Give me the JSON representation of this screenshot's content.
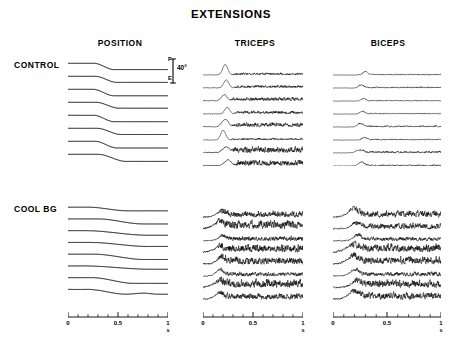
{
  "figure": {
    "title": "EXTENSIONS",
    "column_headers": [
      "POSITION",
      "TRICEPS",
      "BICEPS"
    ],
    "row_labels": [
      "CONTROL",
      "COOL BG"
    ]
  },
  "calibration": {
    "top_letter": "F",
    "bottom_letter": "E",
    "magnitude": "40°"
  },
  "axes": {
    "unit": "s",
    "tick_labels": [
      "0",
      "0.5",
      "1"
    ],
    "minor_ticks": 10,
    "range": [
      0,
      1
    ]
  },
  "chart_data": {
    "type": "line",
    "title": "EXTENSIONS",
    "xlabel": "s",
    "ylabel": "",
    "xlim": [
      0,
      1
    ],
    "grid": false,
    "legend": "none",
    "conditions": [
      "CONTROL",
      "COOL BG"
    ],
    "signals": [
      "POSITION",
      "TRICEPS",
      "BICEPS"
    ],
    "trials_per_panel": 8,
    "panels": [
      {
        "condition": "CONTROL",
        "signal": "POSITION",
        "kind": "position",
        "seed": 101,
        "traces": [
          {
            "onset": 0.26,
            "duration": 0.2,
            "amplitude": 0.62,
            "baseline": 0.0,
            "noise": 0.006
          },
          {
            "onset": 0.27,
            "duration": 0.22,
            "amplitude": 0.6,
            "baseline": 0.0,
            "noise": 0.006
          },
          {
            "onset": 0.25,
            "duration": 0.21,
            "amplitude": 0.64,
            "baseline": 0.0,
            "noise": 0.006
          },
          {
            "onset": 0.28,
            "duration": 0.23,
            "amplitude": 0.58,
            "baseline": 0.0,
            "noise": 0.006
          },
          {
            "onset": 0.26,
            "duration": 0.2,
            "amplitude": 0.63,
            "baseline": 0.0,
            "noise": 0.006
          },
          {
            "onset": 0.29,
            "duration": 0.24,
            "amplitude": 0.61,
            "baseline": 0.0,
            "noise": 0.006
          },
          {
            "onset": 0.27,
            "duration": 0.22,
            "amplitude": 0.66,
            "baseline": 0.0,
            "noise": 0.006
          },
          {
            "onset": 0.3,
            "duration": 0.28,
            "amplitude": 0.7,
            "baseline": 0.0,
            "noise": 0.006
          }
        ]
      },
      {
        "condition": "CONTROL",
        "signal": "TRICEPS",
        "kind": "emg",
        "seed": 202,
        "traces": [
          {
            "burst_onset": 0.22,
            "burst_width": 0.035,
            "burst_amp": 0.95,
            "tonic": 0.16,
            "tonic_onset": 0.28,
            "noise": 0.05
          },
          {
            "burst_onset": 0.23,
            "burst_width": 0.035,
            "burst_amp": 0.72,
            "tonic": 0.2,
            "tonic_onset": 0.29,
            "noise": 0.05
          },
          {
            "burst_onset": 0.21,
            "burst_width": 0.04,
            "burst_amp": 0.55,
            "tonic": 0.26,
            "tonic_onset": 0.26,
            "noise": 0.06
          },
          {
            "burst_onset": 0.24,
            "burst_width": 0.035,
            "burst_amp": 0.6,
            "tonic": 0.22,
            "tonic_onset": 0.3,
            "noise": 0.05
          },
          {
            "burst_onset": 0.22,
            "burst_width": 0.045,
            "burst_amp": 0.68,
            "tonic": 0.3,
            "tonic_onset": 0.27,
            "noise": 0.06
          },
          {
            "burst_onset": 0.2,
            "burst_width": 0.035,
            "burst_amp": 0.88,
            "tonic": 0.14,
            "tonic_onset": 0.26,
            "noise": 0.04
          },
          {
            "burst_onset": 0.23,
            "burst_width": 0.05,
            "burst_amp": 0.5,
            "tonic": 0.42,
            "tonic_onset": 0.27,
            "noise": 0.09
          },
          {
            "burst_onset": 0.25,
            "burst_width": 0.045,
            "burst_amp": 0.52,
            "tonic": 0.4,
            "tonic_onset": 0.3,
            "noise": 0.09
          }
        ]
      },
      {
        "condition": "CONTROL",
        "signal": "BICEPS",
        "kind": "emg",
        "seed": 303,
        "traces": [
          {
            "burst_onset": 0.3,
            "burst_width": 0.03,
            "burst_amp": 0.3,
            "tonic": 0.07,
            "tonic_onset": 0.2,
            "noise": 0.03
          },
          {
            "burst_onset": 0.26,
            "burst_width": 0.035,
            "burst_amp": 0.22,
            "tonic": 0.09,
            "tonic_onset": 0.2,
            "noise": 0.035
          },
          {
            "burst_onset": 0.28,
            "burst_width": 0.03,
            "burst_amp": 0.2,
            "tonic": 0.06,
            "tonic_onset": 0.22,
            "noise": 0.03
          },
          {
            "burst_onset": 0.27,
            "burst_width": 0.03,
            "burst_amp": 0.24,
            "tonic": 0.07,
            "tonic_onset": 0.21,
            "noise": 0.03
          },
          {
            "burst_onset": 0.25,
            "burst_width": 0.04,
            "burst_amp": 0.26,
            "tonic": 0.1,
            "tonic_onset": 0.2,
            "noise": 0.04
          },
          {
            "burst_onset": 0.29,
            "burst_width": 0.03,
            "burst_amp": 0.18,
            "tonic": 0.08,
            "tonic_onset": 0.22,
            "noise": 0.035
          },
          {
            "burst_onset": 0.24,
            "burst_width": 0.045,
            "burst_amp": 0.22,
            "tonic": 0.14,
            "tonic_onset": 0.2,
            "noise": 0.05
          },
          {
            "burst_onset": 0.26,
            "burst_width": 0.04,
            "burst_amp": 0.3,
            "tonic": 0.1,
            "tonic_onset": 0.21,
            "noise": 0.04
          }
        ]
      },
      {
        "condition": "COOL BG",
        "signal": "POSITION",
        "kind": "position",
        "seed": 404,
        "traces": [
          {
            "onset": 0.2,
            "duration": 0.4,
            "amplitude": 0.4,
            "baseline": 0.0,
            "noise": 0.01
          },
          {
            "onset": 0.3,
            "duration": 0.45,
            "amplitude": 0.55,
            "baseline": 0.0,
            "noise": 0.012
          },
          {
            "onset": 0.18,
            "duration": 0.62,
            "amplitude": 0.5,
            "baseline": 0.0,
            "noise": 0.012
          },
          {
            "onset": 0.22,
            "duration": 0.58,
            "amplitude": 0.44,
            "baseline": 0.0,
            "noise": 0.01
          },
          {
            "onset": 0.26,
            "duration": 0.5,
            "amplitude": 0.58,
            "baseline": 0.0,
            "noise": 0.012
          },
          {
            "onset": 0.16,
            "duration": 0.66,
            "amplitude": 0.36,
            "baseline": 0.0,
            "noise": 0.01
          },
          {
            "onset": 0.24,
            "duration": 0.42,
            "amplitude": 0.62,
            "baseline": 0.0,
            "noise": 0.014
          },
          {
            "onset": 0.2,
            "duration": 0.38,
            "amplitude": 0.52,
            "baseline": 0.0,
            "noise": 0.016,
            "rebound": 0.4
          }
        ]
      },
      {
        "condition": "COOL BG",
        "signal": "TRICEPS",
        "kind": "emg",
        "seed": 505,
        "traces": [
          {
            "burst_onset": 0.16,
            "burst_width": 0.06,
            "burst_amp": 0.4,
            "tonic": 0.46,
            "tonic_onset": 0.14,
            "noise": 0.16
          },
          {
            "burst_onset": 0.14,
            "burst_width": 0.07,
            "burst_amp": 0.5,
            "tonic": 0.62,
            "tonic_onset": 0.12,
            "noise": 0.22
          },
          {
            "burst_onset": 0.18,
            "burst_width": 0.055,
            "burst_amp": 0.34,
            "tonic": 0.34,
            "tonic_onset": 0.15,
            "noise": 0.13
          },
          {
            "burst_onset": 0.15,
            "burst_width": 0.065,
            "burst_amp": 0.42,
            "tonic": 0.58,
            "tonic_onset": 0.13,
            "noise": 0.2
          },
          {
            "burst_onset": 0.17,
            "burst_width": 0.06,
            "burst_amp": 0.46,
            "tonic": 0.54,
            "tonic_onset": 0.14,
            "noise": 0.19
          },
          {
            "burst_onset": 0.16,
            "burst_width": 0.05,
            "burst_amp": 0.58,
            "tonic": 0.3,
            "tonic_onset": 0.14,
            "noise": 0.12
          },
          {
            "burst_onset": 0.14,
            "burst_width": 0.07,
            "burst_amp": 0.44,
            "tonic": 0.6,
            "tonic_onset": 0.12,
            "noise": 0.21
          },
          {
            "burst_onset": 0.15,
            "burst_width": 0.06,
            "burst_amp": 0.52,
            "tonic": 0.44,
            "tonic_onset": 0.13,
            "noise": 0.17
          }
        ]
      },
      {
        "condition": "COOL BG",
        "signal": "BICEPS",
        "kind": "emg",
        "seed": 606,
        "traces": [
          {
            "burst_onset": 0.18,
            "burst_width": 0.07,
            "burst_amp": 0.66,
            "tonic": 0.48,
            "tonic_onset": 0.14,
            "noise": 0.19
          },
          {
            "burst_onset": 0.2,
            "burst_width": 0.06,
            "burst_amp": 0.4,
            "tonic": 0.42,
            "tonic_onset": 0.16,
            "noise": 0.16
          },
          {
            "burst_onset": 0.22,
            "burst_width": 0.055,
            "burst_amp": 0.44,
            "tonic": 0.3,
            "tonic_onset": 0.18,
            "noise": 0.12
          },
          {
            "burst_onset": 0.16,
            "burst_width": 0.075,
            "burst_amp": 0.52,
            "tonic": 0.6,
            "tonic_onset": 0.14,
            "noise": 0.22
          },
          {
            "burst_onset": 0.17,
            "burst_width": 0.07,
            "burst_amp": 0.58,
            "tonic": 0.56,
            "tonic_onset": 0.14,
            "noise": 0.21
          },
          {
            "burst_onset": 0.19,
            "burst_width": 0.06,
            "burst_amp": 0.5,
            "tonic": 0.32,
            "tonic_onset": 0.16,
            "noise": 0.13
          },
          {
            "burst_onset": 0.21,
            "burst_width": 0.065,
            "burst_amp": 0.46,
            "tonic": 0.58,
            "tonic_onset": 0.17,
            "noise": 0.2
          },
          {
            "burst_onset": 0.18,
            "burst_width": 0.07,
            "burst_amp": 0.62,
            "tonic": 0.52,
            "tonic_onset": 0.15,
            "noise": 0.19
          }
        ]
      }
    ]
  },
  "layout": {
    "panels": [
      {
        "x": 68,
        "y": 62,
        "w": 100,
        "h": 104
      },
      {
        "x": 203,
        "y": 62,
        "w": 100,
        "h": 104
      },
      {
        "x": 333,
        "y": 62,
        "w": 108,
        "h": 104
      },
      {
        "x": 68,
        "y": 206,
        "w": 100,
        "h": 94
      },
      {
        "x": 203,
        "y": 206,
        "w": 100,
        "h": 94
      },
      {
        "x": 333,
        "y": 206,
        "w": 108,
        "h": 94
      }
    ],
    "axes": [
      {
        "x": 68,
        "y": 312,
        "w": 100
      },
      {
        "x": 203,
        "y": 312,
        "w": 100
      },
      {
        "x": 333,
        "y": 312,
        "w": 108
      }
    ]
  }
}
